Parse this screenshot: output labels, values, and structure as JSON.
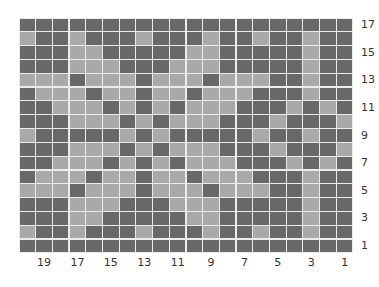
{
  "chart_data": {
    "type": "heatmap",
    "title": "",
    "colors": {
      "D": "#686868",
      "L": "#a9a9a9",
      "gridline": "#ececec"
    },
    "n_columns": 20,
    "n_rows": 17,
    "row_labels": [
      17,
      15,
      13,
      11,
      9,
      7,
      5,
      3,
      1
    ],
    "row_label_position": "right",
    "column_labels": [
      19,
      17,
      15,
      13,
      11,
      9,
      7,
      5,
      3,
      1
    ],
    "column_label_position": "bottom",
    "rows": [
      {
        "row": 17,
        "cells": "DDDDDDDDDDDDDDDDDDDD"
      },
      {
        "row": 16,
        "cells": "LDDLDDDLDDDLDDLDDLDD"
      },
      {
        "row": 15,
        "cells": "DDDLLDDDDDLLDDDDDLDD"
      },
      {
        "row": 14,
        "cells": "DDDLLLDDDLLLDDDDDLDD"
      },
      {
        "row": 13,
        "cells": "LLLDLLLDLLLDLLLDDLDD"
      },
      {
        "row": 12,
        "cells": "DLLLDLLDLLDLLLDDDLDD"
      },
      {
        "row": 11,
        "cells": "DDLLLDLDLDLLLDDDLDLD"
      },
      {
        "row": 10,
        "cells": "DDDLLLDLDLLLDDDLDDDL"
      },
      {
        "row": 9,
        "cells": "LDDDDDLDLDDDDDLDDLDD"
      },
      {
        "row": 8,
        "cells": "DDDLLLDLDLLLDDDLDDDL"
      },
      {
        "row": 7,
        "cells": "DDLLLDLDLDLLLDDDLDLD"
      },
      {
        "row": 6,
        "cells": "DLLLDLLDLLDLLLDDDLDD"
      },
      {
        "row": 5,
        "cells": "LLLDLLLDLLLDLLLDDLDD"
      },
      {
        "row": 4,
        "cells": "DDDLLLDDDLLLDDDDDLDD"
      },
      {
        "row": 3,
        "cells": "DDDLLDDDDDLLDDDDDLDD"
      },
      {
        "row": 2,
        "cells": "LDDLDDDLDDDLDDLDDLDD"
      },
      {
        "row": 1,
        "cells": "DDDDDDDDDDDDDDDDDDDD"
      }
    ]
  }
}
